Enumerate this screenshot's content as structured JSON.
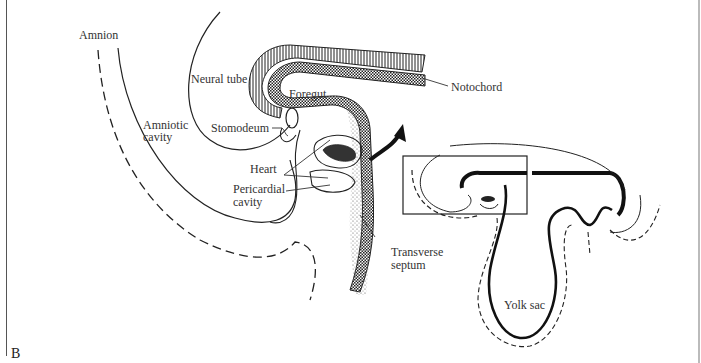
{
  "figure": {
    "panel_letter": "B",
    "labels": {
      "amnion": "Amnion",
      "neural_tube": "Neural tube",
      "notochord": "Notochord",
      "foregut": "Foregut",
      "amniotic_cavity_1": "Amniotic",
      "amniotic_cavity_2": "cavity",
      "stomodeum": "Stomodeum",
      "heart": "Heart",
      "pericardial_cavity_1": "Pericardial",
      "pericardial_cavity_2": "cavity",
      "transverse_septum_1": "Transverse",
      "transverse_septum_2": "septum",
      "yolk_sac": "Yolk sac"
    },
    "colors": {
      "line": "#222222",
      "background": "#ffffff",
      "label": "#333333"
    }
  }
}
